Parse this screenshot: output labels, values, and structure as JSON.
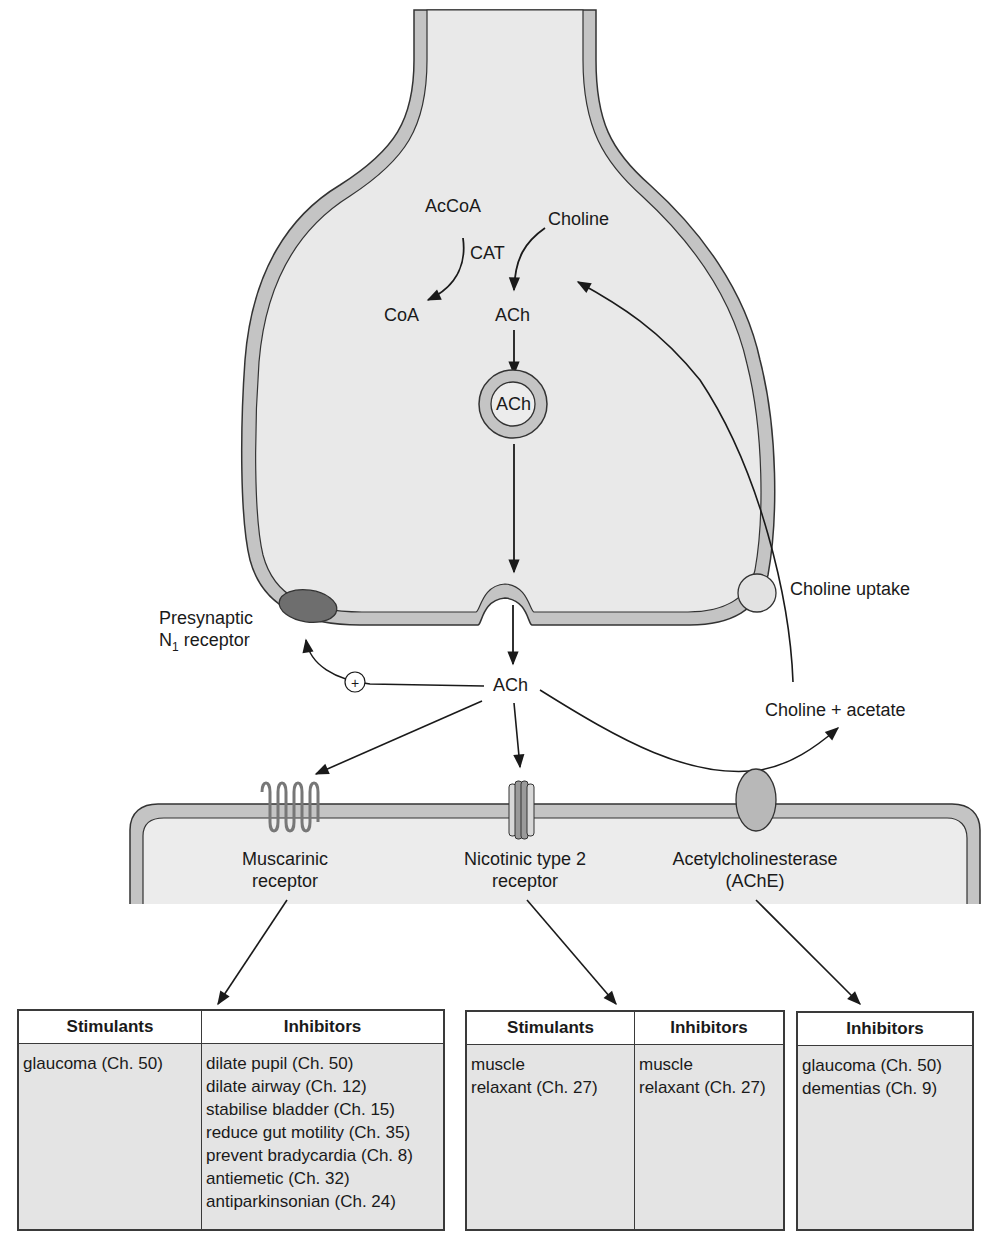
{
  "colors": {
    "membrane": "#c4c4c4",
    "cytoplasm": "#e9e9e9",
    "outline": "#333333",
    "n1_receptor": "#6e6e6e",
    "choline_uptake": "#e2e2e2",
    "ache": "#b8b8b8",
    "table_header_bg": "#ffffff",
    "table_body_bg": "#e4e4e4"
  },
  "presynaptic": {
    "acetyl_coa": "AcCoA",
    "enzyme": "CAT",
    "coa": "CoA",
    "choline": "Choline",
    "ach_synth": "ACh",
    "vesicle_ach": "ACh",
    "n1_receptor_line1": "Presynaptic",
    "n1_receptor_line2_prefix": "N",
    "n1_receptor_sub": "1",
    "n1_receptor_line2_suffix": " receptor",
    "choline_uptake": "Choline uptake",
    "plus_sign": "+"
  },
  "synapse": {
    "ach_released": "ACh",
    "breakdown_products": "Choline + acetate"
  },
  "postsynaptic": {
    "receptors": [
      {
        "line1": "Muscarinic",
        "line2": "receptor"
      },
      {
        "line1": "Nicotinic type 2",
        "line2": "receptor"
      },
      {
        "line1": "Acetylcholinesterase",
        "line2": "(AChE)"
      }
    ]
  },
  "tables": {
    "muscarinic": {
      "headers": [
        "Stimulants",
        "Inhibitors"
      ],
      "stimulants": [
        "glaucoma (Ch. 50)"
      ],
      "inhibitors": [
        "dilate pupil (Ch. 50)",
        "dilate airway (Ch. 12)",
        "stabilise bladder (Ch. 15)",
        "reduce gut motility (Ch. 35)",
        "prevent bradycardia (Ch. 8)",
        "antiemetic (Ch. 32)",
        "antiparkinsonian (Ch. 24)"
      ]
    },
    "nicotinic": {
      "headers": [
        "Stimulants",
        "Inhibitors"
      ],
      "stimulants": [
        "muscle",
        "relaxant (Ch. 27)"
      ],
      "inhibitors": [
        "muscle",
        "relaxant (Ch. 27)"
      ]
    },
    "ache": {
      "headers": [
        "Inhibitors"
      ],
      "inhibitors": [
        "glaucoma (Ch. 50)",
        "dementias (Ch. 9)"
      ]
    }
  }
}
